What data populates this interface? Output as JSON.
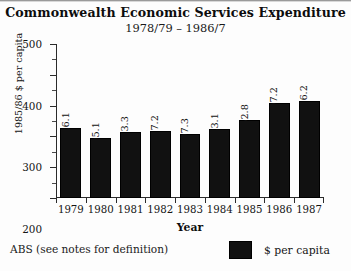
{
  "chart_data": {
    "type": "bar",
    "title": "Commonwealth Economic Services Expenditure",
    "subtitle": "1978/79 – 1986/7",
    "xlabel": "Year",
    "ylabel": "1985/86 $ per capita",
    "categories": [
      "1979",
      "1980",
      "1981",
      "1982",
      "1983",
      "1984",
      "1985",
      "1986",
      "1987"
    ],
    "values": [
      226.1,
      195.1,
      213.3,
      217.2,
      207.3,
      223.1,
      252.8,
      307.2,
      316.2
    ],
    "value_labels": [
      "226.1",
      "195.1",
      "213.3",
      "217.2",
      "207.3",
      "223.1",
      "252.8",
      "307.2",
      "316.2"
    ],
    "ylim": [
      0,
      500
    ],
    "yticks": [
      0,
      100,
      200,
      300,
      400,
      500
    ],
    "ytick_labels": [
      "0",
      "100",
      "200",
      "300",
      "400",
      "500"
    ],
    "yminor_ticks": [
      50,
      150,
      250,
      350,
      450
    ],
    "grid": false,
    "legend_position": "bottom-right",
    "series": [
      {
        "name": "$ per capita",
        "color": "#111111",
        "values": [
          226.1,
          195.1,
          213.3,
          217.2,
          207.3,
          223.1,
          252.8,
          307.2,
          316.2
        ]
      }
    ]
  },
  "legend": {
    "label": "$ per capita"
  },
  "footnote": {
    "text": "ABS (see notes for definition)"
  }
}
